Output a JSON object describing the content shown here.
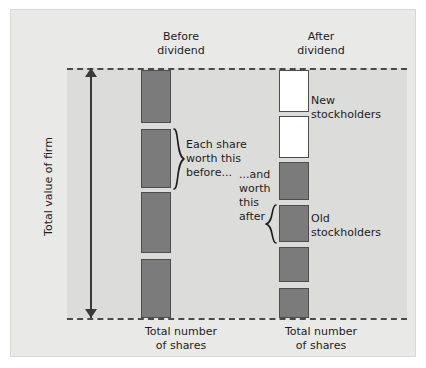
{
  "figure": {
    "title_vertical_axis": "Total value of firm",
    "columns": [
      {
        "id": "before",
        "header": "Before\ndividend",
        "footer": "Total number\nof shares"
      },
      {
        "id": "after",
        "header": "After\ndividend",
        "footer": "Total number\nof shares"
      }
    ],
    "annotations": {
      "before_brace": "Each share\nworth this\nbefore...",
      "after_brace": "...and\nworth\nthis\nafter",
      "new_stockholders": "New\nstockholders",
      "old_stockholders": "Old\nstockholders"
    },
    "colors": {
      "page_background": "#ffffff",
      "canvas_background": "#e9e9e7",
      "plot_background": "#dcdcda",
      "bar_filled": "#7b7b7b",
      "bar_empty": "#ffffff",
      "bar_border": "#4e4e4e",
      "line": "#4a4a4a",
      "text": "#1d1d1d"
    }
  },
  "chart_data": {
    "type": "bar",
    "title": "",
    "xlabel": "Total number of shares",
    "ylabel": "Total value of firm",
    "grid": false,
    "legend": [
      "New stockholders",
      "Old stockholders"
    ],
    "axis_band": {
      "top_px": 58,
      "bottom_px": 308
    },
    "series": [
      {
        "name": "Before dividend",
        "column_x": 130,
        "bar_width": 30,
        "bars": [
          {
            "index": 1,
            "top": 60,
            "height": 53,
            "fill": "filled"
          },
          {
            "index": 2,
            "top": 119,
            "height": 59,
            "fill": "filled"
          },
          {
            "index": 3,
            "top": 182,
            "height": 61,
            "fill": "filled"
          },
          {
            "index": 4,
            "top": 249,
            "height": 59,
            "fill": "filled"
          }
        ],
        "share_count": 4,
        "value_per_share_relative": 1.0
      },
      {
        "name": "After dividend",
        "column_x": 268,
        "bar_width": 30,
        "bars": [
          {
            "index": 1,
            "top": 60,
            "height": 42,
            "fill": "empty",
            "owner": "New stockholders"
          },
          {
            "index": 2,
            "top": 106,
            "height": 42,
            "fill": "empty",
            "owner": "New stockholders"
          },
          {
            "index": 3,
            "top": 152,
            "height": 38,
            "fill": "filled",
            "owner": "Old stockholders"
          },
          {
            "index": 4,
            "top": 195,
            "height": 37,
            "fill": "filled",
            "owner": "Old stockholders"
          },
          {
            "index": 5,
            "top": 237,
            "height": 35,
            "fill": "filled",
            "owner": "Old stockholders"
          },
          {
            "index": 6,
            "top": 278,
            "height": 30,
            "fill": "filled",
            "owner": "Old stockholders"
          }
        ],
        "share_count": 6,
        "value_per_share_relative": 0.667
      }
    ]
  }
}
